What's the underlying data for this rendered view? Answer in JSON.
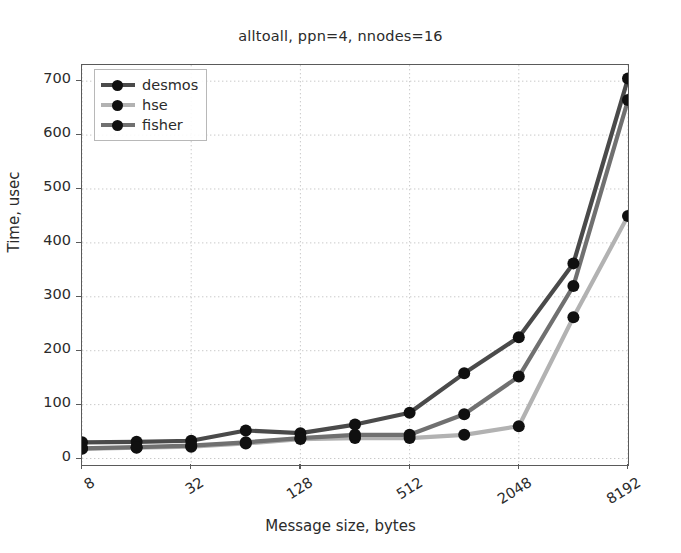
{
  "chart_data": {
    "type": "line",
    "title": "alltoall, ppn=4, nnodes=16",
    "xlabel": "Message size, bytes",
    "ylabel": "Time, usec",
    "grid": true,
    "legend_position": "upper left",
    "x_scale": "log2",
    "x": [
      8,
      16,
      32,
      64,
      128,
      256,
      512,
      1024,
      2048,
      4096,
      8192
    ],
    "xticks": [
      8,
      32,
      128,
      512,
      2048,
      8192
    ],
    "xtick_labels": [
      "8",
      "32",
      "128",
      "512",
      "2048",
      "8192"
    ],
    "xlim": [
      8,
      8192
    ],
    "yticks": [
      0,
      100,
      200,
      300,
      400,
      500,
      600,
      700
    ],
    "ytick_labels": [
      "0",
      "100",
      "200",
      "300",
      "400",
      "500",
      "600",
      "700"
    ],
    "ylim": [
      -12,
      730
    ],
    "series": [
      {
        "name": "desmos",
        "color": "#4a4a4a",
        "marker": "o",
        "values": [
          30,
          31,
          33,
          52,
          47,
          63,
          85,
          158,
          225,
          362,
          705
        ]
      },
      {
        "name": "hse",
        "color": "#b2b2b2",
        "marker": "o",
        "values": [
          18,
          20,
          22,
          28,
          36,
          38,
          38,
          44,
          60,
          262,
          450
        ]
      },
      {
        "name": "fisher",
        "color": "#707070",
        "marker": "o",
        "values": [
          19,
          21,
          24,
          30,
          38,
          44,
          44,
          82,
          152,
          320,
          665
        ]
      }
    ]
  },
  "legend": {
    "entries": [
      {
        "label": "desmos"
      },
      {
        "label": "hse"
      },
      {
        "label": "fisher"
      }
    ]
  }
}
